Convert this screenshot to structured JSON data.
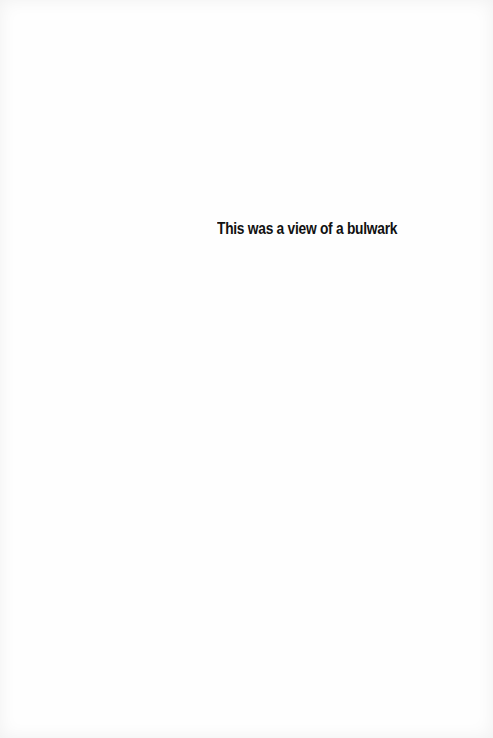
{
  "page": {
    "text": "This was a view of a bulwark",
    "text_color": "#111111",
    "background_color": "#fefefe"
  }
}
